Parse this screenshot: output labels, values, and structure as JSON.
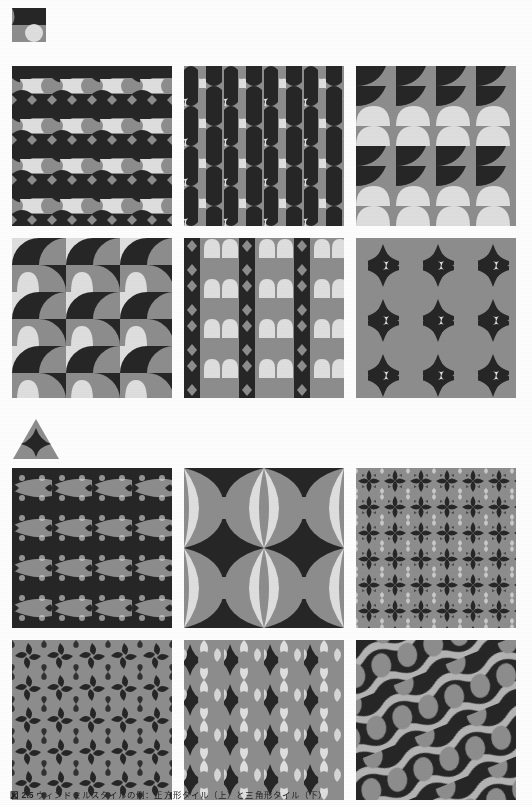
{
  "figure": {
    "caption_number": "図 2.5",
    "caption_text": "ウィンドミルスタイルの例：正方形タイル（上）と三角形タイル（下）",
    "background": "#fdfdfd"
  },
  "palette": {
    "dark": "#262626",
    "mid": "#8d8d8d",
    "light": "#dedede",
    "ink": "#222222"
  },
  "sections": [
    {
      "id": "square-section",
      "prototile": {
        "name": "square-prototile-icon",
        "shape": "square",
        "label": "square tile"
      },
      "panels": [
        {
          "id": "panel-1",
          "name": "pattern-panel-square-1",
          "motif": "horizontal-bands-spool",
          "row": 1,
          "col": 1
        },
        {
          "id": "panel-2",
          "name": "pattern-panel-square-2",
          "motif": "vertical-columns-spool",
          "row": 1,
          "col": 2
        },
        {
          "id": "panel-3",
          "name": "pattern-panel-square-3",
          "motif": "quarter-circle-bands",
          "row": 1,
          "col": 3
        },
        {
          "id": "panel-4",
          "name": "pattern-panel-square-4",
          "motif": "staggered-half-discs",
          "row": 2,
          "col": 1
        },
        {
          "id": "panel-5",
          "name": "pattern-panel-square-5",
          "motif": "vertical-stripes-lobes",
          "row": 2,
          "col": 2
        },
        {
          "id": "panel-6",
          "name": "pattern-panel-square-6",
          "motif": "star-lattice-bowties",
          "row": 2,
          "col": 3
        }
      ]
    },
    {
      "id": "triangle-section",
      "prototile": {
        "name": "triangle-prototile-icon",
        "shape": "triangle",
        "label": "triangle tile"
      },
      "panels": [
        {
          "id": "panel-7",
          "name": "pattern-panel-triangle-1",
          "motif": "dense-fractal-fish",
          "row": 1,
          "col": 1
        },
        {
          "id": "panel-8",
          "name": "pattern-panel-triangle-2",
          "motif": "large-lens-curves",
          "row": 1,
          "col": 2
        },
        {
          "id": "panel-9",
          "name": "pattern-panel-triangle-3",
          "motif": "pinwheel-fractal-fine",
          "row": 1,
          "col": 3
        },
        {
          "id": "panel-10",
          "name": "pattern-panel-triangle-4",
          "motif": "triskelion-pinwheels",
          "row": 2,
          "col": 1
        },
        {
          "id": "panel-11",
          "name": "pattern-panel-triangle-5",
          "motif": "hourglass-goblets",
          "row": 2,
          "col": 2
        },
        {
          "id": "panel-12",
          "name": "pattern-panel-triangle-6",
          "motif": "diagonal-ribbon-waves",
          "row": 2,
          "col": 3
        }
      ]
    }
  ]
}
